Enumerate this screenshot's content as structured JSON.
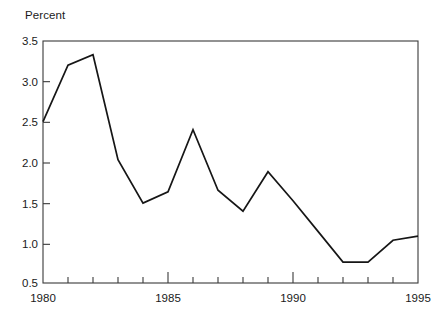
{
  "chart_data": {
    "type": "line",
    "title": "",
    "subtitle": "",
    "xlabel": "",
    "ylabel": "Percent",
    "ylabel_position": "above-axis-top-left",
    "x": [
      1980,
      1981,
      1982,
      1983,
      1984,
      1985,
      1986,
      1987,
      1988,
      1989,
      1990,
      1991,
      1992,
      1993,
      1994,
      1995
    ],
    "values": [
      2.5,
      3.2,
      3.33,
      2.03,
      1.49,
      1.63,
      2.4,
      1.65,
      1.39,
      1.88,
      1.52,
      1.14,
      0.76,
      0.76,
      1.03,
      1.08
    ],
    "series": [
      {
        "name": "Percent",
        "values": [
          2.5,
          3.2,
          3.33,
          2.03,
          1.49,
          1.63,
          2.4,
          1.65,
          1.39,
          1.88,
          1.52,
          1.14,
          0.76,
          0.76,
          1.03,
          1.08
        ],
        "color": "#161616"
      }
    ],
    "xlim": [
      1980,
      1995
    ],
    "ylim": [
      0.5,
      3.5
    ],
    "y_ticks": [
      0.5,
      1.0,
      1.5,
      2.0,
      2.5,
      3.0,
      3.5
    ],
    "y_tick_labels": [
      "0.5",
      "1.0",
      "1.5",
      "2.0",
      "2.5",
      "3.0",
      "3.5"
    ],
    "x_ticks": [
      1980,
      1981,
      1982,
      1983,
      1984,
      1985,
      1986,
      1987,
      1988,
      1989,
      1990,
      1991,
      1992,
      1993,
      1994,
      1995
    ],
    "x_tick_labels_shown": [
      "1980",
      "1985",
      "1990",
      "1995"
    ],
    "x_labeled_ticks": [
      1980,
      1985,
      1990,
      1995
    ],
    "grid": false,
    "legend": false,
    "legend_position": "none",
    "frame": "box",
    "annotations": [],
    "colors": {
      "line": "#161616",
      "axis": "#3a3a3a",
      "background": "#ffffff",
      "text": "#1a1a1a"
    }
  },
  "labels": {
    "y_axis_title": "Percent",
    "y_0": "0.5",
    "y_1": "1.0",
    "y_2": "1.5",
    "y_3": "2.0",
    "y_4": "2.5",
    "y_5": "3.0",
    "y_6": "3.5",
    "x_0": "1980",
    "x_1": "1985",
    "x_2": "1990",
    "x_3": "1995"
  }
}
